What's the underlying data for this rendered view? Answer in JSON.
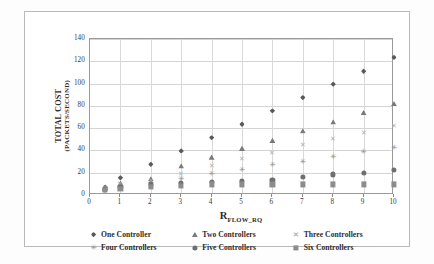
{
  "chart_data": {
    "type": "scatter",
    "title": "",
    "xlabel": "R_FLOW_RQ",
    "xlabel_base": "R",
    "xlabel_sub": "FLOW_RQ",
    "ylabel": "TOTAL COST",
    "ylabel_sub": "(PACKETS/SECOND)",
    "xlim": [
      0,
      10
    ],
    "ylim": [
      0,
      140
    ],
    "xticks": [
      0,
      1,
      2,
      3,
      4,
      5,
      6,
      7,
      8,
      9,
      10
    ],
    "yticks": [
      0,
      20,
      40,
      60,
      80,
      100,
      120,
      140
    ],
    "grid": true,
    "legend_position": "bottom",
    "x": [
      0.5,
      1,
      2,
      3,
      4,
      5,
      6,
      7,
      8,
      9,
      10
    ],
    "series": [
      {
        "name": "One Controller",
        "marker": "diamond",
        "color": "#595959",
        "values": [
          7,
          15.5,
          27.5,
          39.5,
          51.5,
          63.5,
          75.5,
          87.5,
          99.5,
          111,
          123.5
        ]
      },
      {
        "name": "Two Controllers",
        "marker": "triangle",
        "color": "#7a7a7a",
        "values": [
          6.5,
          10.5,
          14.5,
          26,
          34,
          42,
          49,
          57.5,
          65.5,
          74,
          82
        ]
      },
      {
        "name": "Three Controllers",
        "marker": "cross",
        "color": "#b2b2b2",
        "values": [
          6,
          9.5,
          12.5,
          18.5,
          26,
          32.5,
          38,
          44.5,
          50,
          55.5,
          61.5
        ]
      },
      {
        "name": "Four Controllers",
        "marker": "star",
        "color": "#949494",
        "values": [
          5.5,
          8.5,
          11,
          14.5,
          19,
          22.5,
          26.5,
          30,
          34,
          38.5,
          42
        ]
      },
      {
        "name": "Five Controllers",
        "marker": "circle",
        "color": "#6f6f6f",
        "values": [
          5,
          7.5,
          9.5,
          11,
          12,
          13,
          13.5,
          16.5,
          18.5,
          20,
          22.5
        ]
      },
      {
        "name": "Six Controllers",
        "marker": "square",
        "color": "#8c8c8c",
        "values": [
          4.5,
          5.5,
          7,
          8.5,
          9.5,
          9.5,
          9.5,
          9.5,
          9.5,
          9.5,
          9.5
        ]
      }
    ]
  }
}
